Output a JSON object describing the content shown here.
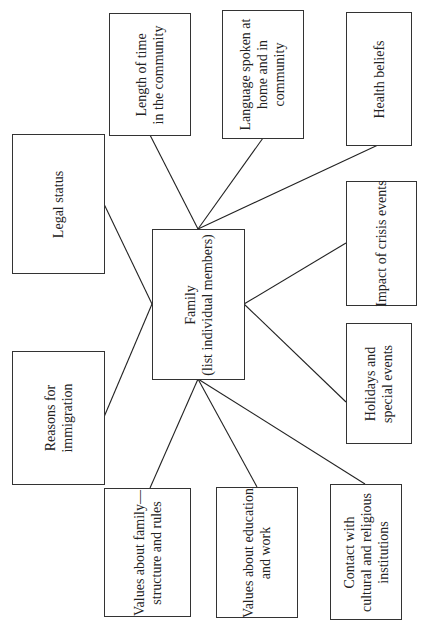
{
  "diagram": {
    "type": "radial concept map (rotated 90°)",
    "center": {
      "label": "Family\n(list individual members)"
    },
    "nodes": [
      {
        "id": "length",
        "label": "Length of time\nin the community"
      },
      {
        "id": "language",
        "label": "Language spoken at\nhome and in\ncommunity"
      },
      {
        "id": "health",
        "label": "Health beliefs"
      },
      {
        "id": "legal",
        "label": "Legal status"
      },
      {
        "id": "crisis",
        "label": "Impact of crisis events"
      },
      {
        "id": "reasons",
        "label": "Reasons for\nimmigration"
      },
      {
        "id": "holidays",
        "label": "Holidays and\nspecial events"
      },
      {
        "id": "values_family",
        "label": "Values about family—\nstructure and rules"
      },
      {
        "id": "values_education",
        "label": "Values about education\nand work"
      },
      {
        "id": "contact",
        "label": "Contact with\ncultural and religious\ninstitutions"
      }
    ],
    "colors": {
      "line": "#222222",
      "border": "#333333",
      "text": "#222222",
      "background": "#ffffff"
    }
  }
}
